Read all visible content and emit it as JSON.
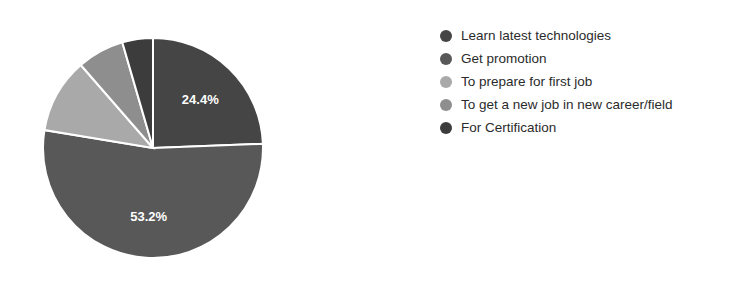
{
  "chart_data": {
    "type": "pie",
    "title": "",
    "legend_position": "right",
    "labels": [
      "Learn latest technologies",
      "Get promotion",
      "To prepare for first job",
      "To get a new job in new career/field",
      "For Certification"
    ],
    "values": [
      24.4,
      53.2,
      11.0,
      6.9,
      4.5
    ],
    "colors": [
      "#454545",
      "#585858",
      "#a9a9a9",
      "#8e8e8e",
      "#3c3c3c"
    ],
    "start_angle": 0,
    "direction": "clockwise",
    "slice_separator_color": "#ffffff",
    "visible_data_labels": [
      {
        "slice": "Learn latest technologies",
        "text": "24.4%"
      },
      {
        "slice": "Get promotion",
        "text": "53.2%"
      }
    ]
  },
  "legend": {
    "items": [
      {
        "label": "Learn latest technologies",
        "color": "#454545"
      },
      {
        "label": "Get promotion",
        "color": "#585858"
      },
      {
        "label": "To prepare for first job",
        "color": "#a9a9a9"
      },
      {
        "label": "To get a new job in new career/field",
        "color": "#8e8e8e"
      },
      {
        "label": "For Certification",
        "color": "#3c3c3c"
      }
    ]
  }
}
